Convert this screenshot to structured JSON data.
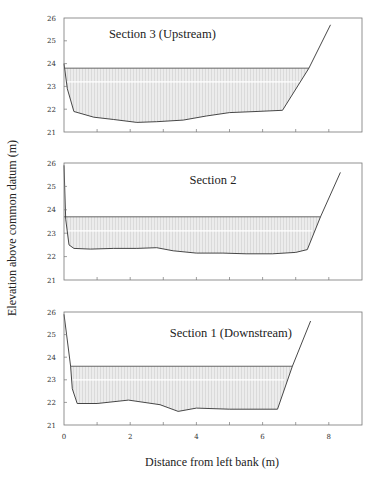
{
  "chart_data": {
    "type": "area",
    "xlabel": "Distance from left bank (m)",
    "ylabel": "Elevation above common datum (m)",
    "x_ticks": [
      0,
      1,
      2,
      3,
      4,
      5,
      6,
      7,
      8,
      9
    ],
    "x_tick_labels": [
      "0",
      "2",
      "4",
      "6",
      "8"
    ],
    "x_tick_label_values": [
      0,
      2,
      4,
      6,
      8
    ],
    "xlim": [
      0,
      9
    ],
    "ylim": [
      21,
      26
    ],
    "y_ticks": [
      21,
      22,
      23,
      24,
      25,
      26
    ],
    "y_tick_labels": [
      "21",
      "22",
      "23",
      "24",
      "25",
      "26"
    ],
    "grid": false,
    "fill_color": "#e6e6e6",
    "line_color": "#333333",
    "panels": [
      {
        "title": "Section 3 (Upstream)",
        "title_pos": [
          0.33,
          0.9
        ],
        "water_level": 23.8,
        "water_extent": [
          0,
          7.4
        ],
        "bed": {
          "x": [
            0,
            0.1,
            0.3,
            0.9,
            1.5,
            2.2,
            2.8,
            3.6,
            4.3,
            5.0,
            5.8,
            6.6,
            7.4,
            8.05
          ],
          "y": [
            24.0,
            22.9,
            21.9,
            21.65,
            21.55,
            21.42,
            21.45,
            21.52,
            21.7,
            21.85,
            21.9,
            21.95,
            23.8,
            25.7
          ]
        }
      },
      {
        "title": "Section 2",
        "title_pos": [
          0.5,
          0.9
        ],
        "water_level": 23.7,
        "water_extent": [
          0,
          7.75
        ],
        "bed": {
          "x": [
            0,
            0.05,
            0.15,
            0.3,
            0.8,
            1.5,
            2.2,
            2.8,
            3.3,
            4.0,
            4.8,
            5.5,
            6.3,
            7.0,
            7.35,
            7.75,
            8.35
          ],
          "y": [
            25.9,
            23.6,
            22.5,
            22.35,
            22.32,
            22.35,
            22.35,
            22.38,
            22.25,
            22.15,
            22.15,
            22.12,
            22.12,
            22.18,
            22.3,
            23.7,
            25.6
          ]
        }
      },
      {
        "title": "Section 1 (Downstream)",
        "title_pos": [
          0.56,
          0.86
        ],
        "water_level": 23.6,
        "water_extent": [
          0.2,
          6.9
        ],
        "bed": {
          "x": [
            0,
            0.2,
            0.25,
            0.4,
            1.0,
            1.95,
            2.9,
            3.45,
            4.0,
            5.0,
            6.45,
            6.9,
            7.45
          ],
          "y": [
            25.9,
            23.6,
            22.6,
            21.95,
            21.95,
            22.1,
            21.9,
            21.6,
            21.75,
            21.7,
            21.7,
            23.6,
            25.6
          ]
        }
      }
    ]
  },
  "figure": {
    "xlabel": "Distance from left bank (m)",
    "ylabel": "Elevation above common datum (m)"
  }
}
